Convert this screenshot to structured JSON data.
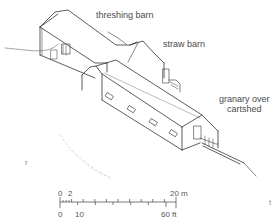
{
  "diagram": {
    "type": "isometric architectural drawing",
    "labels": {
      "threshing_barn": "threshing barn",
      "straw_barn": "straw barn",
      "granary_line1": "granary over",
      "granary_line2": "cartshed"
    },
    "scale_bar": {
      "metric_start": "0",
      "metric_mid": "2",
      "metric_end": "20 m",
      "imperial_start": "0",
      "imperial_mid": "10",
      "imperial_end": "60 ft"
    },
    "corner_marks": {
      "left": "r",
      "right": "t"
    },
    "colors": {
      "line": "#333333",
      "light_line": "#9a9a9a",
      "text": "#4a4a4a",
      "background": "#ffffff"
    }
  }
}
